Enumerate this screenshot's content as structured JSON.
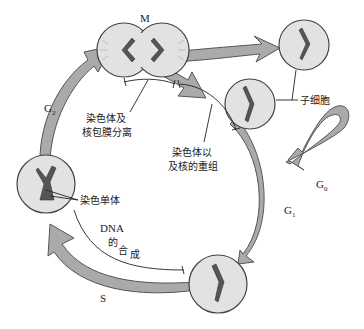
{
  "diagram": {
    "phases": {
      "M": "M",
      "G1": "G",
      "G1_sub": "1",
      "G2": "G",
      "G2_sub": "2",
      "G0": "G",
      "G0_sub": "0",
      "S": "S"
    },
    "labels": {
      "daughter_cells": "子细胞",
      "chromosome_separation_line1": "染色体及",
      "chromosome_separation_line2": "核包膜分离",
      "reorganization_line1": "染色体以",
      "reorganization_line2": "及核的重组",
      "chromatids": "染色单体",
      "dna_synthesis_1": "DNA",
      "dna_synthesis_2": "的",
      "dna_synthesis_3": "合",
      "dna_synthesis_4": "成"
    },
    "colors": {
      "cell_fill": "#e2e2e2",
      "arrow_fill": "#aaaaaa",
      "chromosome": "#555555"
    }
  }
}
